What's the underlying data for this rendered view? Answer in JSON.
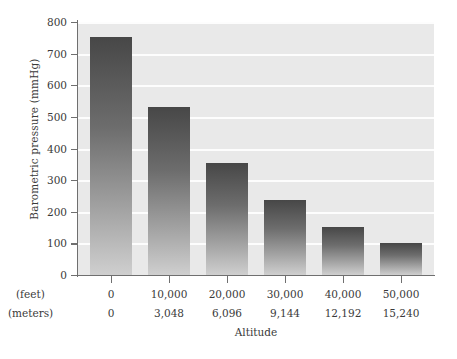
{
  "chart_data": {
    "type": "bar",
    "title": "",
    "xlabel": "Altitude",
    "ylabel": "Barometric pressure (mmHg)",
    "categories": [
      "0",
      "10,000",
      "20,000",
      "30,000",
      "40,000",
      "50,000"
    ],
    "values": [
      753,
      531,
      354,
      237,
      152,
      101
    ],
    "ylim": [
      0,
      800
    ],
    "yticks": [
      0,
      100,
      200,
      300,
      400,
      500,
      600,
      700,
      800
    ],
    "ytick_labels": [
      "0",
      "100",
      "200",
      "300",
      "400",
      "500",
      "600",
      "700",
      "800"
    ],
    "grid": true,
    "grid_color": "#fdfdfd",
    "legend": "none",
    "plot_background": "#e9e9e9",
    "bar_gradient_top": "#474747",
    "bar_gradient_bottom": "#cfcfcf",
    "axis_color": "#6f6f6f",
    "series": [
      {
        "name": "Barometric pressure",
        "values": [
          753,
          531,
          354,
          237,
          152,
          101
        ]
      }
    ],
    "x_axis_rows": [
      {
        "unit_label": "(feet)",
        "values": [
          "0",
          "10,000",
          "20,000",
          "30,000",
          "40,000",
          "50,000"
        ]
      },
      {
        "unit_label": "(meters)",
        "values": [
          "0",
          "3,048",
          "6,096",
          "9,144",
          "12,192",
          "15,240"
        ]
      }
    ]
  }
}
